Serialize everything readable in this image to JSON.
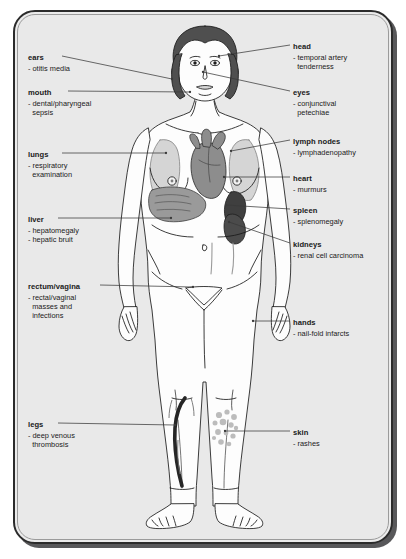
{
  "diagram": {
    "kind": "clinical-examination-body-map",
    "panel": {
      "background_color": "#e9e9e9",
      "border_color": "#2b2b2b",
      "shadow_color": "#58585a"
    },
    "palette": {
      "hair": "#4f4f4f",
      "skin_outline": "#1a1a1a",
      "skin_fill": "#fdfdfd",
      "heart": "#8d8d8d",
      "liver": "#9a9a9a",
      "lungs": "#c9c9c9",
      "spleen": "#3f3f3f",
      "kidney": "#4b4b4b",
      "vein_dvt": "#262626",
      "rash": "#b9b9b9",
      "leader_line": "#3a3a3a"
    }
  },
  "labels_left": [
    {
      "id": "ears",
      "title": "ears",
      "items": [
        "- otitis media"
      ],
      "x": 28,
      "y": 53,
      "leader": {
        "x1": 62,
        "y1": 56,
        "x2": 172,
        "y2": 79
      }
    },
    {
      "id": "mouth",
      "title": "mouth",
      "items": [
        "- dental/pharyngeal",
        "sepsis"
      ],
      "x": 28,
      "y": 88,
      "leader": {
        "x1": 68,
        "y1": 91,
        "x2": 190,
        "y2": 92
      }
    },
    {
      "id": "lungs",
      "title": "lungs",
      "items": [
        "- respiratory",
        "examination"
      ],
      "x": 28,
      "y": 150,
      "leader": {
        "x1": 62,
        "y1": 153,
        "x2": 166,
        "y2": 153
      }
    },
    {
      "id": "liver",
      "title": "liver",
      "items": [
        "- hepatomegaly",
        "- hepatic bruit"
      ],
      "x": 28,
      "y": 215,
      "leader": {
        "x1": 58,
        "y1": 218,
        "x2": 171,
        "y2": 218
      }
    },
    {
      "id": "rectum-vagina",
      "title": "rectum/vagina",
      "items": [
        "- rectal/vaginal",
        "masses and",
        "infections"
      ],
      "x": 28,
      "y": 282,
      "leader": {
        "x1": 100,
        "y1": 285,
        "x2": 193,
        "y2": 287
      }
    },
    {
      "id": "legs",
      "title": "legs",
      "items": [
        "- deep venous",
        "thrombosis"
      ],
      "x": 28,
      "y": 420,
      "leader": {
        "x1": 58,
        "y1": 423,
        "x2": 175,
        "y2": 425
      }
    }
  ],
  "labels_right": [
    {
      "id": "head",
      "title": "head",
      "items": [
        "- temporal artery",
        "tenderness"
      ],
      "x": 293,
      "y": 42,
      "leader": {
        "x1": 290,
        "y1": 45,
        "x2": 219,
        "y2": 56
      }
    },
    {
      "id": "eyes",
      "title": "eyes",
      "items": [
        "- conjunctival",
        "petechiae"
      ],
      "x": 293,
      "y": 88,
      "leader": {
        "x1": 290,
        "y1": 91,
        "x2": 203,
        "y2": 72
      }
    },
    {
      "id": "lymph-nodes",
      "title": "lymph nodes",
      "items": [
        "- lymphadenopathy"
      ],
      "x": 293,
      "y": 137,
      "leader": {
        "x1": 290,
        "y1": 140,
        "x2": 231,
        "y2": 151
      }
    },
    {
      "id": "heart",
      "title": "heart",
      "items": [
        "- murmurs"
      ],
      "x": 293,
      "y": 174,
      "leader": {
        "x1": 290,
        "y1": 177,
        "x2": 224,
        "y2": 177
      }
    },
    {
      "id": "spleen",
      "title": "spleen",
      "items": [
        "- splenomegaly"
      ],
      "x": 293,
      "y": 206,
      "leader": {
        "x1": 290,
        "y1": 209,
        "x2": 226,
        "y2": 205
      }
    },
    {
      "id": "kidneys",
      "title": "kidneys",
      "items": [
        "- renal cell carcinoma"
      ],
      "x": 293,
      "y": 240,
      "leader": {
        "x1": 290,
        "y1": 243,
        "x2": 229,
        "y2": 222
      }
    },
    {
      "id": "hands",
      "title": "hands",
      "items": [
        "- nail-fold infarcts"
      ],
      "x": 293,
      "y": 318,
      "leader": {
        "x1": 290,
        "y1": 321,
        "x2": 253,
        "y2": 321
      }
    },
    {
      "id": "skin",
      "title": "skin",
      "items": [
        "- rashes"
      ],
      "x": 293,
      "y": 428,
      "leader": {
        "x1": 290,
        "y1": 431,
        "x2": 225,
        "y2": 431
      }
    }
  ]
}
